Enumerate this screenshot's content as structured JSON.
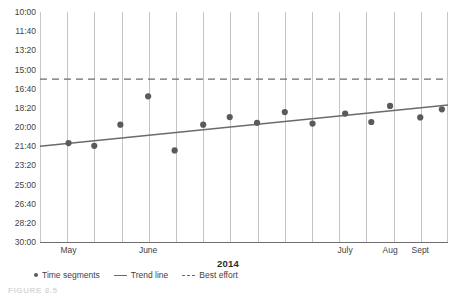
{
  "chart_data": {
    "type": "scatter",
    "title": "",
    "xlabel": "2014",
    "ylabel": "",
    "grid": "vertical",
    "legend_position": "bottom-left",
    "y_axis": {
      "inverted": true,
      "unit": "mm:ss",
      "ticks": [
        "10:00",
        "11:40",
        "13:20",
        "15:00",
        "16:40",
        "18:20",
        "20:00",
        "21:40",
        "23:20",
        "25:00",
        "26:40",
        "28:20",
        "30:00"
      ],
      "tick_seconds": [
        600,
        700,
        800,
        900,
        1000,
        1100,
        1200,
        1300,
        1400,
        1500,
        1600,
        1700,
        1800
      ],
      "ylim_seconds": [
        600,
        1800
      ]
    },
    "x_axis": {
      "ticks": [
        "May",
        "June",
        "July",
        "Aug",
        "Sept"
      ],
      "tick_positions": [
        0.07,
        0.265,
        0.748,
        0.858,
        0.932
      ],
      "gridline_count": 14
    },
    "series": [
      {
        "name": "Time segments",
        "type": "scatter",
        "color": "#5a5a5a",
        "points": [
          {
            "x": 0.07,
            "label": "21:24",
            "seconds": 1284
          },
          {
            "x": 0.133,
            "label": "21:38",
            "seconds": 1298
          },
          {
            "x": 0.197,
            "label": "19:48",
            "seconds": 1188
          },
          {
            "x": 0.265,
            "label": "17:20",
            "seconds": 1040
          },
          {
            "x": 0.33,
            "label": "22:02",
            "seconds": 1322
          },
          {
            "x": 0.4,
            "label": "19:48",
            "seconds": 1188
          },
          {
            "x": 0.465,
            "label": "19:08",
            "seconds": 1148
          },
          {
            "x": 0.532,
            "label": "19:38",
            "seconds": 1178
          },
          {
            "x": 0.6,
            "label": "18:42",
            "seconds": 1122
          },
          {
            "x": 0.668,
            "label": "19:42",
            "seconds": 1182
          },
          {
            "x": 0.748,
            "label": "18:50",
            "seconds": 1130
          },
          {
            "x": 0.812,
            "label": "19:34",
            "seconds": 1174
          },
          {
            "x": 0.858,
            "label": "18:10",
            "seconds": 1090
          },
          {
            "x": 0.932,
            "label": "19:10",
            "seconds": 1150
          },
          {
            "x": 0.985,
            "label": "18:28",
            "seconds": 1108
          }
        ]
      },
      {
        "name": "Trend line",
        "type": "line",
        "color": "#6b6b6b",
        "style": "solid",
        "start": {
          "x": 0.0,
          "seconds": 1300
        },
        "end": {
          "x": 1.0,
          "seconds": 1085
        }
      },
      {
        "name": "Best effort",
        "type": "line",
        "color": "#6b6b6b",
        "style": "dashed",
        "value_label": "15:50",
        "seconds": 950
      }
    ]
  },
  "legend": {
    "items": [
      {
        "label": "Time segments",
        "marker": "dot-marker"
      },
      {
        "label": "Trend line",
        "marker": "solid-line-marker"
      },
      {
        "label": "Best effort",
        "marker": "dashed-line-marker"
      }
    ]
  },
  "caption": {
    "text": "FIGURE 8.5"
  },
  "colors": {
    "point": "#5a5a5a",
    "trend": "#6b6b6b",
    "best_effort": "#6b6b6b",
    "gridline": "#c4c4c4",
    "axis": "#6e6e6e",
    "text": "#3f3f3f"
  }
}
